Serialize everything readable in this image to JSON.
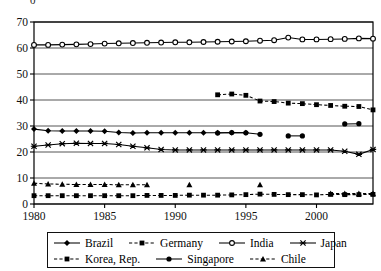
{
  "chart_data": {
    "type": "line",
    "title": "",
    "xlabel": "",
    "ylabel": "",
    "xlim": [
      1980,
      2004
    ],
    "ylim": [
      0,
      70
    ],
    "ytick_values": [
      0,
      10,
      20,
      30,
      40,
      50,
      60,
      70
    ],
    "xtick_values": [
      1980,
      1985,
      1990,
      1995,
      2000
    ],
    "grid": "horizontal",
    "legend_position": "below",
    "cutoff_top_label": "0",
    "series": [
      {
        "name": "Brazil",
        "marker": "diamond",
        "linestyle": "solid",
        "x": [
          1980,
          1981,
          1982,
          1983,
          1984,
          1985,
          1986,
          1987,
          1988,
          1989,
          1990,
          1991,
          1992,
          1993,
          1994,
          1995
        ],
        "values": [
          28.8,
          28.2,
          28.1,
          28.1,
          28.1,
          28.0,
          27.5,
          27.3,
          27.4,
          27.4,
          27.4,
          27.4,
          27.4,
          27.4,
          27.4,
          27.4
        ]
      },
      {
        "name": "Germany",
        "marker": "square",
        "linestyle": "dashed",
        "x": [
          1993,
          1994,
          1995,
          1996,
          1997,
          1998,
          1999,
          2000,
          2001,
          2002,
          2003,
          2004
        ],
        "values": [
          42.0,
          42.3,
          41.8,
          39.6,
          39.4,
          38.8,
          38.6,
          38.2,
          37.9,
          37.6,
          37.5,
          36.2
        ]
      },
      {
        "name": "India",
        "marker": "circle-open",
        "linestyle": "solid",
        "x": [
          1980,
          1981,
          1982,
          1983,
          1984,
          1985,
          1986,
          1987,
          1988,
          1989,
          1990,
          1991,
          1992,
          1993,
          1994,
          1995,
          1996,
          1997,
          1998,
          1999,
          2000,
          2001,
          2002,
          2003,
          2004
        ],
        "values": [
          61.2,
          61.2,
          61.3,
          61.4,
          61.5,
          61.7,
          61.8,
          61.9,
          62.0,
          62.1,
          62.2,
          62.2,
          62.3,
          62.4,
          62.5,
          62.6,
          62.8,
          63.0,
          64.0,
          63.3,
          63.3,
          63.4,
          63.5,
          63.7,
          63.6
        ]
      },
      {
        "name": "Japan",
        "marker": "x",
        "linestyle": "solid",
        "x": [
          1980,
          1981,
          1982,
          1983,
          1984,
          1985,
          1986,
          1987,
          1988,
          1989,
          1990,
          1991,
          1992,
          1993,
          1994,
          1995,
          1996,
          1997,
          1998,
          1999,
          2000,
          2001,
          2002,
          2003,
          2004
        ],
        "values": [
          22.2,
          22.7,
          23.2,
          23.4,
          23.3,
          23.3,
          22.9,
          22.2,
          21.6,
          21.0,
          20.8,
          20.8,
          20.8,
          20.8,
          20.8,
          20.8,
          20.8,
          20.8,
          20.8,
          20.8,
          20.8,
          20.8,
          20.3,
          19.1,
          21.0
        ]
      },
      {
        "name": "Korea, Rep.",
        "marker": "square",
        "linestyle": "dashed",
        "x": [
          1980,
          1981,
          1982,
          1983,
          1984,
          1985,
          1986,
          1987,
          1988,
          1989,
          1990,
          1991,
          1992,
          1993,
          1994,
          1995,
          1996,
          1997,
          1998,
          1999,
          2000,
          2001,
          2002,
          2003,
          2004
        ],
        "values": [
          3.2,
          3.2,
          3.2,
          3.2,
          3.2,
          3.2,
          3.2,
          3.2,
          3.3,
          3.3,
          3.3,
          3.4,
          3.4,
          3.4,
          3.5,
          3.6,
          3.8,
          3.7,
          3.6,
          3.6,
          3.5,
          3.7,
          3.6,
          3.6,
          3.7
        ]
      },
      {
        "name": "Singapore",
        "marker": "circle-filled",
        "linestyle": "solid",
        "x": [
          1993,
          1994,
          1995,
          1996,
          1998,
          1999,
          2002,
          2003
        ],
        "values": [
          27.3,
          27.5,
          27.4,
          26.8,
          26.2,
          26.2,
          30.8,
          30.9
        ]
      },
      {
        "name": "Chile",
        "marker": "triangle",
        "linestyle": "dashed",
        "x": [
          1980,
          1981,
          1982,
          1983,
          1984,
          1985,
          1986,
          1987,
          1988,
          1991,
          1996,
          2001,
          2002,
          2003,
          2004
        ],
        "values": [
          8.0,
          7.7,
          7.6,
          7.5,
          7.5,
          7.5,
          7.4,
          7.4,
          7.4,
          7.4,
          7.4,
          4.0,
          4.0,
          4.0,
          4.0
        ]
      }
    ]
  },
  "legend": {
    "rows": [
      [
        {
          "label": "Brazil",
          "marker": "diamond",
          "linestyle": "solid"
        },
        {
          "label": "Germany",
          "marker": "square",
          "linestyle": "dashed"
        },
        {
          "label": "India",
          "marker": "circle-open",
          "linestyle": "solid"
        },
        {
          "label": "Japan",
          "marker": "x",
          "linestyle": "solid"
        }
      ],
      [
        {
          "label": "Korea, Rep.",
          "marker": "square",
          "linestyle": "dashed"
        },
        {
          "label": "Singapore",
          "marker": "circle-filled",
          "linestyle": "solid"
        },
        {
          "label": "Chile",
          "marker": "triangle",
          "linestyle": "dashed"
        }
      ]
    ]
  }
}
